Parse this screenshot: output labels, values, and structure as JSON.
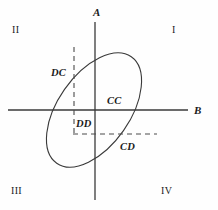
{
  "figure": {
    "type": "diagram",
    "background_color": "#fefefe",
    "line_color": "#3a3a3a",
    "text_color": "#1b1b1b"
  },
  "axes": {
    "vertical": {
      "name": "A",
      "label": "A",
      "x": 95,
      "y_top": 22,
      "y_bottom": 200,
      "label_x": 93,
      "label_y": 7
    },
    "horizontal": {
      "name": "B",
      "label": "B",
      "y": 110,
      "x_left": 8,
      "x_right": 188,
      "label_x": 194,
      "label_y": 105
    }
  },
  "quadrants": [
    {
      "id": "q1",
      "label": "I",
      "x": 172,
      "y": 25
    },
    {
      "id": "q2",
      "label": "II",
      "x": 12,
      "y": 25
    },
    {
      "id": "q3",
      "label": "III",
      "x": 11,
      "y": 186
    },
    {
      "id": "q4",
      "label": "IV",
      "x": 161,
      "y": 186
    }
  ],
  "ellipse": {
    "name": "tilted-ellipse",
    "center_x": 94,
    "center_y": 110,
    "radius_x": 36,
    "radius_y": 65,
    "rotation_deg": 35,
    "stroke_width": 1.1
  },
  "guides": [
    {
      "id": "vertical-dashed",
      "orientation": "vertical",
      "x": 74,
      "y_start": 47,
      "y_end": 136,
      "dash": "5,4"
    },
    {
      "id": "horizontal-dashed",
      "orientation": "horizontal",
      "y": 134,
      "x_start": 73,
      "x_end": 157,
      "dash": "5,4"
    }
  ],
  "regions": [
    {
      "id": "dc",
      "label": "DC",
      "x": 51,
      "y": 68
    },
    {
      "id": "cc",
      "label": "CC",
      "x": 107,
      "y": 96
    },
    {
      "id": "dd",
      "label": "DD",
      "x": 76,
      "y": 119
    },
    {
      "id": "cd",
      "label": "CD",
      "x": 120,
      "y": 142
    }
  ]
}
